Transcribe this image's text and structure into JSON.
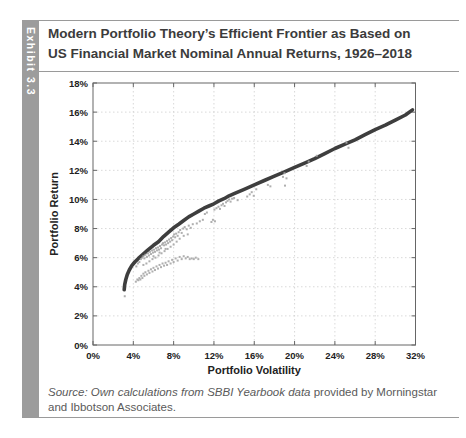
{
  "exhibit": {
    "tab_label": "Exhibit 3.3"
  },
  "header": {
    "title_line1": "Modern Portfolio Theory’s Efficient Frontier as Based on",
    "title_line2": "US Financial Market Nominal Annual Returns, 1926–2018"
  },
  "source": {
    "italic_part": "Source: Own calculations from SBBI Yearbook data",
    "regular_part": " provided by Morningstar and Ibbotson Associates."
  },
  "colors": {
    "frontier_line": "#3e3e3e",
    "scatter": "#a6a6a6",
    "grid": "#cfcfcf",
    "axis": "#666666",
    "tab_bg": "#9c9c9c",
    "title_text": "#3b3b3b",
    "source_text": "#5a5a5a"
  },
  "chart_data": {
    "type": "scatter",
    "title": "",
    "xlabel": "Portfolio Volatility",
    "ylabel": "Portfolio Return",
    "xlim": [
      0,
      32
    ],
    "ylim": [
      0,
      18
    ],
    "x_ticks": [
      0,
      4,
      8,
      12,
      16,
      20,
      24,
      28,
      32
    ],
    "x_tick_labels": [
      "0%",
      "4%",
      "8%",
      "12%",
      "16%",
      "20%",
      "24%",
      "28%",
      "32%"
    ],
    "y_ticks": [
      0,
      2,
      4,
      6,
      8,
      10,
      12,
      14,
      16,
      18
    ],
    "y_tick_labels": [
      "0%",
      "2%",
      "4%",
      "6%",
      "8%",
      "10%",
      "12%",
      "14%",
      "16%",
      "18%"
    ],
    "grid": "dotted",
    "legend": "none",
    "series": [
      {
        "name": "efficient-frontier",
        "type": "line",
        "color": "#3e3e3e",
        "points": [
          [
            3.1,
            3.8
          ],
          [
            3.15,
            4.15
          ],
          [
            3.25,
            4.5
          ],
          [
            3.4,
            4.85
          ],
          [
            3.6,
            5.15
          ],
          [
            3.85,
            5.45
          ],
          [
            4.15,
            5.7
          ],
          [
            4.5,
            5.95
          ],
          [
            4.9,
            6.2
          ],
          [
            5.4,
            6.5
          ],
          [
            6.0,
            6.85
          ],
          [
            6.5,
            7.1
          ],
          [
            7.0,
            7.45
          ],
          [
            7.5,
            7.75
          ],
          [
            8.0,
            8.05
          ],
          [
            8.5,
            8.3
          ],
          [
            9.0,
            8.55
          ],
          [
            9.5,
            8.8
          ],
          [
            10.0,
            9.0
          ],
          [
            10.5,
            9.2
          ],
          [
            11.0,
            9.4
          ],
          [
            11.5,
            9.55
          ],
          [
            12.0,
            9.7
          ],
          [
            12.5,
            9.9
          ],
          [
            13.0,
            10.05
          ],
          [
            13.5,
            10.25
          ],
          [
            14.0,
            10.4
          ],
          [
            15.0,
            10.7
          ],
          [
            16.0,
            11.0
          ],
          [
            17.0,
            11.3
          ],
          [
            18.0,
            11.6
          ],
          [
            19.0,
            11.9
          ],
          [
            20.0,
            12.2
          ],
          [
            21.0,
            12.5
          ],
          [
            22.0,
            12.8
          ],
          [
            23.0,
            13.15
          ],
          [
            24.0,
            13.5
          ],
          [
            25.0,
            13.8
          ],
          [
            26.0,
            14.1
          ],
          [
            27.0,
            14.45
          ],
          [
            28.0,
            14.8
          ],
          [
            29.0,
            15.1
          ],
          [
            30.0,
            15.45
          ],
          [
            31.0,
            15.8
          ],
          [
            31.7,
            16.15
          ]
        ]
      },
      {
        "name": "random-portfolios",
        "type": "scatter",
        "color": "#a6a6a6",
        "points": [
          [
            3.15,
            3.35
          ],
          [
            4.25,
            4.35
          ],
          [
            4.4,
            4.5
          ],
          [
            4.3,
            5.4
          ],
          [
            4.45,
            5.6
          ],
          [
            4.6,
            5.7
          ],
          [
            4.75,
            5.9
          ],
          [
            4.9,
            6.0
          ],
          [
            5.0,
            6.1
          ],
          [
            5.1,
            5.95
          ],
          [
            5.2,
            6.2
          ],
          [
            5.35,
            6.05
          ],
          [
            5.45,
            6.3
          ],
          [
            5.55,
            6.15
          ],
          [
            5.65,
            6.4
          ],
          [
            5.75,
            6.25
          ],
          [
            5.85,
            6.5
          ],
          [
            5.95,
            6.35
          ],
          [
            6.05,
            6.55
          ],
          [
            6.15,
            6.4
          ],
          [
            6.25,
            6.65
          ],
          [
            6.35,
            6.5
          ],
          [
            6.45,
            6.7
          ],
          [
            6.55,
            6.55
          ],
          [
            6.65,
            6.8
          ],
          [
            6.75,
            6.65
          ],
          [
            6.85,
            6.9
          ],
          [
            6.95,
            7.0
          ],
          [
            7.05,
            6.85
          ],
          [
            7.15,
            7.05
          ],
          [
            7.25,
            6.9
          ],
          [
            7.35,
            7.15
          ],
          [
            7.45,
            7.0
          ],
          [
            7.55,
            7.25
          ],
          [
            7.65,
            7.1
          ],
          [
            7.75,
            7.35
          ],
          [
            7.85,
            7.2
          ],
          [
            7.95,
            7.45
          ],
          [
            8.05,
            7.6
          ],
          [
            8.15,
            7.4
          ],
          [
            8.25,
            7.65
          ],
          [
            8.4,
            7.5
          ],
          [
            8.5,
            7.75
          ],
          [
            8.65,
            7.9
          ],
          [
            8.8,
            7.7
          ],
          [
            8.95,
            8.0
          ],
          [
            9.1,
            8.1
          ],
          [
            9.3,
            7.95
          ],
          [
            9.5,
            8.2
          ],
          [
            9.7,
            8.05
          ],
          [
            9.9,
            8.3
          ],
          [
            4.5,
            4.45
          ],
          [
            4.6,
            4.6
          ],
          [
            4.7,
            4.5
          ],
          [
            4.8,
            4.75
          ],
          [
            4.9,
            4.6
          ],
          [
            5.0,
            4.9
          ],
          [
            5.1,
            4.75
          ],
          [
            5.2,
            5.0
          ],
          [
            5.35,
            4.85
          ],
          [
            5.5,
            5.1
          ],
          [
            5.6,
            4.95
          ],
          [
            5.75,
            5.2
          ],
          [
            5.9,
            5.05
          ],
          [
            6.0,
            5.3
          ],
          [
            6.15,
            5.15
          ],
          [
            6.3,
            5.4
          ],
          [
            6.45,
            5.25
          ],
          [
            6.6,
            5.5
          ],
          [
            6.75,
            5.35
          ],
          [
            6.9,
            5.6
          ],
          [
            7.05,
            5.45
          ],
          [
            7.2,
            5.65
          ],
          [
            7.35,
            5.5
          ],
          [
            7.5,
            5.75
          ],
          [
            7.7,
            5.6
          ],
          [
            7.85,
            5.85
          ],
          [
            8.0,
            5.7
          ],
          [
            8.2,
            5.95
          ],
          [
            8.4,
            5.8
          ],
          [
            8.6,
            6.05
          ],
          [
            8.8,
            5.9
          ],
          [
            9.0,
            6.1
          ],
          [
            9.2,
            5.95
          ],
          [
            9.4,
            6.05
          ],
          [
            9.6,
            5.9
          ],
          [
            9.8,
            5.95
          ],
          [
            10.0,
            5.9
          ],
          [
            10.2,
            6.0
          ],
          [
            10.45,
            5.9
          ],
          [
            5.0,
            5.5
          ],
          [
            5.3,
            5.6
          ],
          [
            5.6,
            5.75
          ],
          [
            5.9,
            5.9
          ],
          [
            6.2,
            6.0
          ],
          [
            6.5,
            6.15
          ],
          [
            6.8,
            6.3
          ],
          [
            7.1,
            6.45
          ],
          [
            7.4,
            6.6
          ],
          [
            7.7,
            6.75
          ],
          [
            8.0,
            6.9
          ],
          [
            8.3,
            7.1
          ],
          [
            8.6,
            7.3
          ],
          [
            9.0,
            7.5
          ],
          [
            9.4,
            7.6
          ],
          [
            6.0,
            6.1
          ],
          [
            6.6,
            6.35
          ],
          [
            7.2,
            6.6
          ],
          [
            10.3,
            8.35
          ],
          [
            10.6,
            8.5
          ],
          [
            10.9,
            8.6
          ],
          [
            11.1,
            9.0
          ],
          [
            11.3,
            9.1
          ],
          [
            11.75,
            8.45
          ],
          [
            11.9,
            8.6
          ],
          [
            12.1,
            8.5
          ],
          [
            12.05,
            9.3
          ],
          [
            12.25,
            9.4
          ],
          [
            12.45,
            9.5
          ],
          [
            12.6,
            9.35
          ],
          [
            12.75,
            9.6
          ],
          [
            12.9,
            9.7
          ],
          [
            13.05,
            9.55
          ],
          [
            13.2,
            9.8
          ],
          [
            13.35,
            9.9
          ],
          [
            13.5,
            10.0
          ],
          [
            13.65,
            9.85
          ],
          [
            13.8,
            10.05
          ],
          [
            14.0,
            10.1
          ],
          [
            14.35,
            9.95
          ],
          [
            15.3,
            10.2
          ],
          [
            15.55,
            10.35
          ],
          [
            15.75,
            10.5
          ],
          [
            15.95,
            10.25
          ],
          [
            16.2,
            10.7
          ],
          [
            17.35,
            11.0
          ],
          [
            17.6,
            10.9
          ],
          [
            18.85,
            11.55
          ],
          [
            19.0,
            11.8
          ],
          [
            19.2,
            11.45
          ],
          [
            19.05,
            10.95
          ],
          [
            21.2,
            12.3
          ],
          [
            21.4,
            12.6
          ],
          [
            22.2,
            13.0
          ],
          [
            25.15,
            13.9
          ],
          [
            25.35,
            13.55
          ]
        ]
      }
    ]
  }
}
